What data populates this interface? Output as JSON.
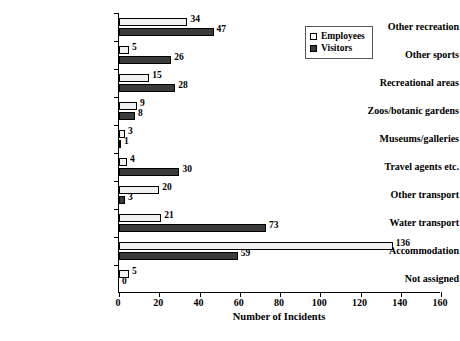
{
  "chart_data": {
    "type": "bar",
    "orientation": "horizontal",
    "title": "",
    "xlabel": "Number of Incidents",
    "ylabel": "",
    "xlim": [
      0,
      160
    ],
    "xticks": [
      0,
      20,
      40,
      60,
      80,
      100,
      120,
      140,
      160
    ],
    "grid": false,
    "legend_position": "top-right",
    "categories": [
      "Other recreation",
      "Other sports",
      "Recreational areas",
      "Zoos/botanic gardens",
      "Museums/galleries",
      "Travel agents etc.",
      "Other transport",
      "Water transport",
      "Accommodation",
      "Not assigned"
    ],
    "series": [
      {
        "name": "Employees",
        "color": "#f1f1f1",
        "values": [
          34,
          5,
          15,
          9,
          3,
          4,
          20,
          21,
          136,
          5
        ]
      },
      {
        "name": "Visitors",
        "color": "#3b3b3b",
        "values": [
          47,
          26,
          28,
          8,
          1,
          30,
          3,
          73,
          59,
          0
        ]
      }
    ]
  },
  "legend": {
    "items": [
      {
        "label": "Employees"
      },
      {
        "label": "Visitors"
      }
    ]
  },
  "axis": {
    "x_title": "Number of Incidents",
    "tick_labels": [
      "0",
      "20",
      "40",
      "60",
      "80",
      "100",
      "120",
      "140",
      "160"
    ]
  },
  "caption": {
    "text": ""
  }
}
